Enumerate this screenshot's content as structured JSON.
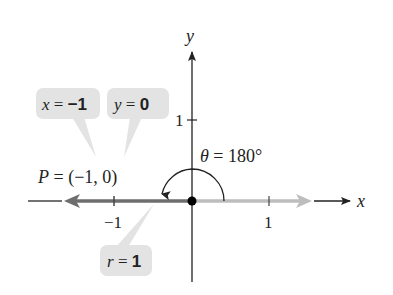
{
  "diagram": {
    "axes": {
      "x_label": "x",
      "y_label": "y",
      "x_ticks": [
        {
          "value": -1,
          "label": "−1"
        },
        {
          "value": 1,
          "label": "1"
        }
      ],
      "y_ticks": [
        {
          "value": 1,
          "label": "1"
        }
      ]
    },
    "angle": {
      "symbol": "θ",
      "equals": " = ",
      "value": "180°"
    },
    "point": {
      "name": "P",
      "equals": " = ",
      "coords": "(−1, 0)"
    },
    "callouts": {
      "x": {
        "var": "x",
        "eq": " = ",
        "val": "−1"
      },
      "y": {
        "var": "y",
        "eq": " = ",
        "val": "0"
      },
      "r": {
        "var": "r",
        "eq": " = ",
        "val": "1"
      }
    },
    "colors": {
      "axis": "#222222",
      "terminal_side": "#6e6e6e",
      "initial_side": "#bdbdbd",
      "callout_fill": "#e3e3e3",
      "origin_point": "#000000"
    }
  }
}
